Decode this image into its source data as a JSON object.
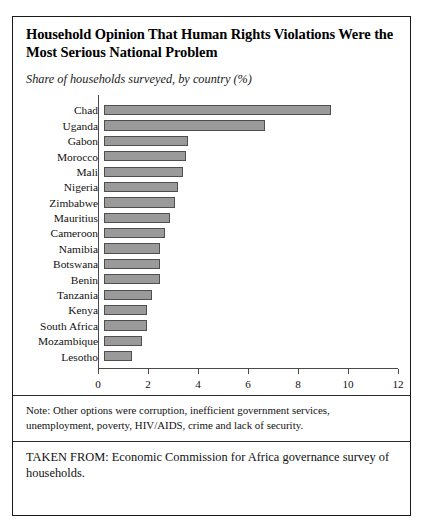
{
  "figure": {
    "title": "Household Opinion That Human Rights Violations Were the Most Serious National Problem",
    "subtitle": "Share of households surveyed, by country (%)",
    "note": "Note: Other options were corruption, inefficient government services, unemployment, poverty, HIV/AIDS, crime and lack of security.",
    "source": "TAKEN FROM: Economic Commission for Africa governance survey of households."
  },
  "colors": {
    "bar_fill": "#9a9a9a",
    "bar_border": "#4f4f4f",
    "frame": "#1a1a1a",
    "axis": "#4a4a4a",
    "text": "#111111"
  },
  "chart_data": {
    "type": "bar",
    "orientation": "horizontal",
    "title": "Household Opinion That Human Rights Violations Were the Most Serious National Problem",
    "subtitle": "Share of households surveyed, by country (%)",
    "xlabel": "",
    "ylabel": "",
    "xlim": [
      0,
      12
    ],
    "xticks": [
      0,
      2,
      4,
      6,
      8,
      10,
      12
    ],
    "xtick_labels": [
      "0",
      "2",
      "4",
      "6",
      "8",
      "10",
      "12"
    ],
    "grid": false,
    "legend": false,
    "categories": [
      "Chad",
      "Uganda",
      "Gabon",
      "Morocco",
      "Mali",
      "Nigeria",
      "Zimbabwe",
      "Mauritius",
      "Cameroon",
      "Namibia",
      "Botswana",
      "Benin",
      "Tanzania",
      "Kenya",
      "South Africa",
      "Mozambique",
      "Lesotho"
    ],
    "values": [
      8.9,
      6.3,
      3.3,
      3.2,
      3.1,
      2.9,
      2.8,
      2.6,
      2.4,
      2.2,
      2.2,
      2.2,
      1.9,
      1.7,
      1.7,
      1.5,
      1.1
    ]
  }
}
